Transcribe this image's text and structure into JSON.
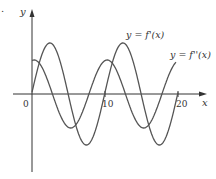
{
  "chart_data": {
    "type": "line",
    "title": "",
    "xlabel": "x",
    "ylabel": "y",
    "x_ticks": [
      "0",
      "10",
      "20"
    ],
    "xlim": [
      0,
      20
    ],
    "grid": false,
    "series": [
      {
        "name": "y = f'(x)",
        "description": "oscillating curve starting at 0, larger amplitude, period about 10",
        "x": [
          0,
          2.5,
          5,
          7.5,
          10,
          12.5,
          15,
          17.5,
          20
        ],
        "values": [
          0,
          1,
          0,
          -1,
          0,
          1,
          0,
          -1,
          0
        ]
      },
      {
        "name": "y = f''(x)",
        "description": "oscillating curve starting positive, smaller amplitude, period about 10",
        "x": [
          0,
          2.5,
          5,
          7.5,
          10,
          12.5,
          15,
          17.5,
          20
        ],
        "values": [
          0.9,
          0,
          -0.9,
          0,
          0.9,
          0,
          -0.9,
          0,
          0.9
        ]
      }
    ],
    "annotations": [
      "y = f'(x)",
      "y = f''(x)"
    ]
  },
  "labels": {
    "y_axis": "y",
    "x_axis": "x",
    "tick_0": "0",
    "tick_10": "10",
    "tick_20": "20",
    "fprime": "y = f'(x)",
    "fdoubleprime": "y = f''(x)",
    "corner_mark": "."
  }
}
